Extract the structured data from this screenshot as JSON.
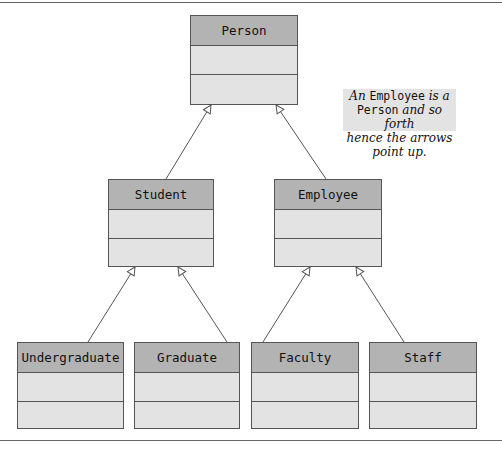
{
  "diagram": {
    "type": "UML class hierarchy",
    "classes": {
      "person": "Person",
      "student": "Student",
      "employee": "Employee",
      "undergraduate": "Undergraduate",
      "graduate": "Graduate",
      "faculty": "Faculty",
      "staff": "Staff"
    },
    "relationships": [
      {
        "from": "Student",
        "to": "Person",
        "type": "inheritance"
      },
      {
        "from": "Employee",
        "to": "Person",
        "type": "inheritance"
      },
      {
        "from": "Undergraduate",
        "to": "Student",
        "type": "inheritance"
      },
      {
        "from": "Graduate",
        "to": "Student",
        "type": "inheritance"
      },
      {
        "from": "Faculty",
        "to": "Employee",
        "type": "inheritance"
      },
      {
        "from": "Staff",
        "to": "Employee",
        "type": "inheritance"
      }
    ],
    "note": {
      "l1_a": "An ",
      "l1_b": "Employee",
      "l1_c": " is a",
      "l2_a": "Person",
      "l2_b": " and so forth",
      "l3": "hence the arrows point up."
    },
    "colors": {
      "header_fill": "#b3b3b3",
      "body_fill": "#e3e3e3",
      "border": "#555555",
      "note_fill": "#e3e3e3"
    }
  }
}
